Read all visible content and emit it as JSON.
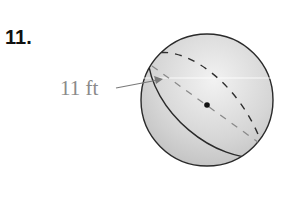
{
  "problem": {
    "number": "11."
  },
  "figure": {
    "type": "sphere",
    "dimension_label": "11 ft",
    "dimension_refers_to": "radius of great circle",
    "center_dot": true,
    "colors": {
      "sphere_fill_light": "#ececec",
      "sphere_fill_dark": "#bdbdbd",
      "outline": "#2a2a2a",
      "dashed_hidden": "#3a3a3a",
      "dashed_radius": "#8a8a8a",
      "label": "#8a8a8a"
    }
  }
}
